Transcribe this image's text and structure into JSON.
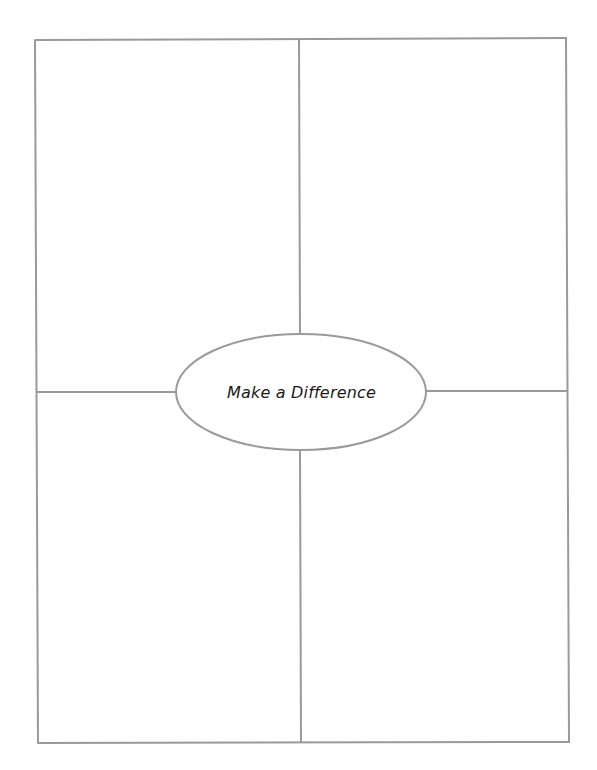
{
  "diagram": {
    "type": "four-square graphic organizer",
    "center_label": "Make a Difference",
    "quadrants": [
      {
        "position": "top-left",
        "text": ""
      },
      {
        "position": "top-right",
        "text": ""
      },
      {
        "position": "bottom-left",
        "text": ""
      },
      {
        "position": "bottom-right",
        "text": ""
      }
    ],
    "colors": {
      "line": "#9a9a9a",
      "text": "#1a1a1a",
      "background": "#ffffff"
    }
  }
}
